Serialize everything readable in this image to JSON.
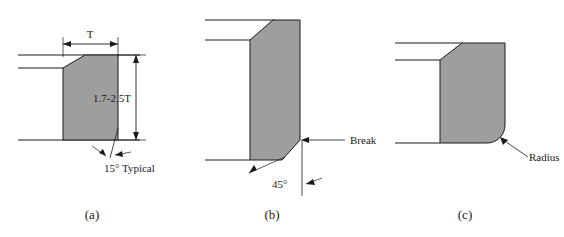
{
  "figure": {
    "title": "",
    "background_color": "#ffffff",
    "fill_color": "#9e9e9e",
    "line_color": "#1a1a1a",
    "panels": [
      {
        "id": "a",
        "caption": "(a)",
        "feature": "chamfered-edge-15-degree",
        "annotations": {
          "width_dim": "T",
          "height_dim": "1.7-2.5T",
          "angle_note": "15° Typical"
        }
      },
      {
        "id": "b",
        "caption": "(b)",
        "feature": "broken-edge-45-degree",
        "annotations": {
          "break_label": "Break",
          "angle_note": "45°"
        }
      },
      {
        "id": "c",
        "caption": "(c)",
        "feature": "radiused-edge",
        "annotations": {
          "radius_label": "Radius"
        }
      }
    ]
  }
}
